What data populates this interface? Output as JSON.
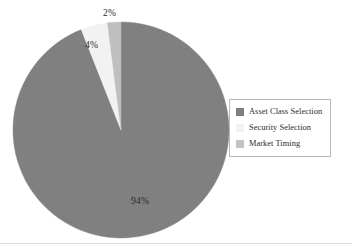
{
  "chart_data": {
    "type": "pie",
    "title": "",
    "subtitle": "",
    "xlabel": "",
    "ylabel": "",
    "grid": false,
    "legend_position": "right",
    "start_angle_deg": 0,
    "direction": "clockwise",
    "center": {
      "cx": 109,
      "cy": 109,
      "r": 108
    },
    "categories": [
      "Asset Class Selection",
      "Security Selection",
      "Market Timing"
    ],
    "values": [
      94,
      4,
      2
    ],
    "value_labels": [
      "94%",
      "4%",
      "2%"
    ],
    "colors": [
      "#808080",
      "#f2f2f2",
      "#bfbfbf"
    ],
    "slices": [
      {
        "name": "Asset Class Selection",
        "value": 94,
        "label": "94%",
        "color": "#808080",
        "start_deg": 0,
        "end_deg": 338.4
      },
      {
        "name": "Security Selection",
        "value": 4,
        "label": "4%",
        "color": "#f2f2f2",
        "start_deg": 338.4,
        "end_deg": 352.8
      },
      {
        "name": "Market Timing",
        "value": 2,
        "label": "2%",
        "color": "#bfbfbf",
        "start_deg": 352.8,
        "end_deg": 360
      }
    ]
  },
  "legend": {
    "items": [
      {
        "label": "Asset Class Selection",
        "color": "#808080"
      },
      {
        "label": "Security Selection",
        "color": "#f2f2f2"
      },
      {
        "label": "Market Timing",
        "color": "#c4c4c4"
      }
    ],
    "border_color": "#b9b9b9"
  },
  "labels": {
    "asset_class_selection": "94%",
    "security_selection": "4%",
    "market_timing": "2%"
  }
}
